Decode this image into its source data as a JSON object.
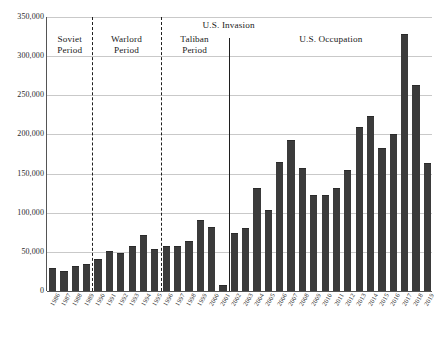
{
  "chart_data": {
    "type": "bar",
    "title": "",
    "subtitle": "",
    "xlabel": "",
    "ylabel": "",
    "ylim": [
      0,
      350000
    ],
    "ytick_values": [
      0,
      50000,
      100000,
      150000,
      200000,
      250000,
      300000,
      350000
    ],
    "ytick_labels": [
      "0",
      "50,000",
      "100,000",
      "150,000",
      "200,000",
      "250,000",
      "300,000",
      "350,000"
    ],
    "grid": true,
    "legend": "none",
    "bar_color": "#3b3b3b",
    "gridline_color": "#c9c9c9",
    "axis_color": "#555555",
    "categories": [
      "1986",
      "1987",
      "1988",
      "1989",
      "1990",
      "1991",
      "1992",
      "1993",
      "1994",
      "1995",
      "1996",
      "1997",
      "1998",
      "1999",
      "2000",
      "2001",
      "2002",
      "2003",
      "2004",
      "2005",
      "2006",
      "2007",
      "2008",
      "2009",
      "2010",
      "2011",
      "2012",
      "2013",
      "2014",
      "2015",
      "2016",
      "2017",
      "2018",
      "2019"
    ],
    "values": [
      29000,
      25000,
      32000,
      34000,
      41000,
      51000,
      49000,
      58000,
      71000,
      54000,
      57000,
      58000,
      64000,
      91000,
      82000,
      8000,
      74000,
      80000,
      131000,
      104000,
      165000,
      193000,
      157000,
      123000,
      123000,
      131000,
      154000,
      209000,
      224000,
      183000,
      201000,
      328000,
      263000,
      163000
    ],
    "annotations": [
      {
        "name": "soviet-period",
        "label": "Soviet\nPeriod",
        "start": "1986",
        "end": "1989"
      },
      {
        "name": "warlord-period",
        "label": "Warlord\nPeriod",
        "start": "1990",
        "end": "1995"
      },
      {
        "name": "taliban-period",
        "label": "Taliban\nPeriod",
        "start": "1996",
        "end": "2001"
      },
      {
        "name": "us-invasion",
        "label": "U.S. Invasion",
        "marker": "2001"
      },
      {
        "name": "us-occupation",
        "label": "U.S. Occupation",
        "start": "2002",
        "end": "2019"
      }
    ],
    "dividers": [
      {
        "name": "soviet-warlord-divider",
        "style": "dashed",
        "after": "1989"
      },
      {
        "name": "warlord-taliban-divider",
        "style": "dashed",
        "after": "1995"
      },
      {
        "name": "us-invasion-divider",
        "style": "solid",
        "after": "2001"
      }
    ]
  }
}
